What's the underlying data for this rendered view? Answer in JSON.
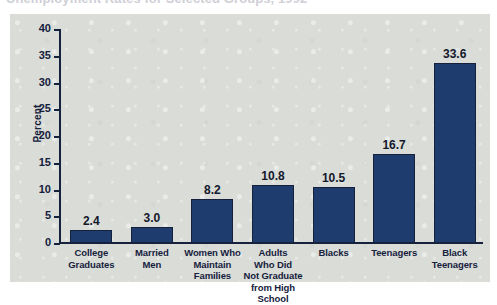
{
  "title": {
    "text": "Unemployment Rates for Selected Groups, 1992",
    "clipped": true
  },
  "chart_data": {
    "type": "bar",
    "title": "Unemployment Rates for Selected Groups, 1992",
    "xlabel": "",
    "ylabel": "Percent",
    "ylim": [
      0,
      40
    ],
    "yticks": [
      0,
      5,
      10,
      15,
      20,
      25,
      30,
      35,
      40
    ],
    "grid": false,
    "legend": "none",
    "bar_color": "#1e3c6e",
    "background_color": "#d9dcd7",
    "categories": [
      "College Graduates",
      "Married Men",
      "Women Who Maintain Families",
      "Adults Who Did Not Graduate from High School",
      "Blacks",
      "Teenagers",
      "Black Teenagers"
    ],
    "category_lines": [
      [
        "College",
        "Graduates"
      ],
      [
        "Married",
        "Men"
      ],
      [
        "Women Who",
        "Maintain",
        "Families"
      ],
      [
        "Adults",
        "Who Did",
        "Not Graduate",
        "from High School"
      ],
      [
        "Blacks"
      ],
      [
        "Teenagers"
      ],
      [
        "Black",
        "Teenagers"
      ]
    ],
    "values": [
      2.4,
      3.0,
      8.2,
      10.8,
      10.5,
      16.7,
      33.6
    ],
    "value_labels": [
      "2.4",
      "3.0",
      "8.2",
      "10.8",
      "10.5",
      "16.7",
      "33.6"
    ]
  },
  "axis": {
    "y_title": "Percent",
    "y_tick_labels": [
      "40",
      "35",
      "30",
      "25",
      "20",
      "15",
      "10",
      "5",
      "0"
    ]
  }
}
